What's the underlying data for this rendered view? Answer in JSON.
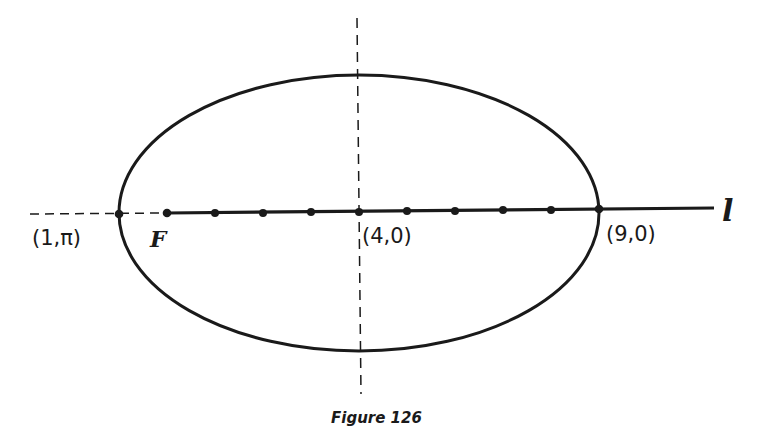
{
  "figure": {
    "caption": "Figure 126",
    "type": "ellipse in polar coordinates",
    "labels": {
      "left_vertex": "(1,π)",
      "focus": "F",
      "center": "(4,0)",
      "right_vertex": "(9,0)",
      "axis": "l"
    },
    "geometry": {
      "center_px": [
        359,
        213
      ],
      "semi_major_px": 240,
      "semi_minor_px": 138,
      "axis_y_px": 213,
      "dot_x_px": [
        119,
        167,
        215,
        263,
        311,
        359,
        407,
        455,
        503,
        551,
        599
      ]
    },
    "colors": {
      "ink": "#1a1a1a",
      "background": "#ffffff"
    }
  }
}
